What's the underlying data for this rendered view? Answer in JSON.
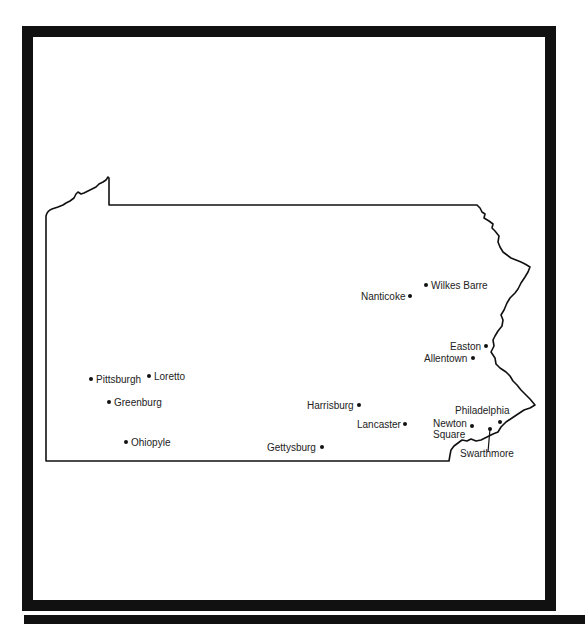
{
  "map": {
    "region": "Pennsylvania",
    "cities": [
      {
        "name": "Pittsburgh",
        "label": "Pittsburgh",
        "dot": [
          91,
          379
        ],
        "label_pos": [
          96,
          374
        ],
        "align": "left"
      },
      {
        "name": "Loretto",
        "label": "Loretto",
        "dot": [
          149,
          376
        ],
        "label_pos": [
          154,
          371
        ],
        "align": "left"
      },
      {
        "name": "Greenburg",
        "label": "Greenburg",
        "dot": [
          109,
          402
        ],
        "label_pos": [
          114,
          397
        ],
        "align": "left"
      },
      {
        "name": "Ohiopyle",
        "label": "Ohiopyle",
        "dot": [
          126,
          442
        ],
        "label_pos": [
          131,
          437
        ],
        "align": "left"
      },
      {
        "name": "Wilkes Barre",
        "label": "Wilkes Barre",
        "dot": [
          426,
          285
        ],
        "label_pos": [
          431,
          280
        ],
        "align": "left"
      },
      {
        "name": "Nanticoke",
        "label": "Nanticoke",
        "dot": [
          410,
          296
        ],
        "label_pos": [
          361,
          291
        ],
        "align": "right"
      },
      {
        "name": "Easton",
        "label": "Easton",
        "dot": [
          486,
          346
        ],
        "label_pos": [
          450,
          341
        ],
        "align": "right"
      },
      {
        "name": "Allentown",
        "label": "Allentown",
        "dot": [
          473,
          358
        ],
        "label_pos": [
          424,
          353
        ],
        "align": "right"
      },
      {
        "name": "Harrisburg",
        "label": "Harrisburg",
        "dot": [
          359,
          405
        ],
        "label_pos": [
          307,
          400
        ],
        "align": "right"
      },
      {
        "name": "Lancaster",
        "label": "Lancaster",
        "dot": [
          405,
          424
        ],
        "label_pos": [
          357,
          419
        ],
        "align": "right"
      },
      {
        "name": "Gettysburg",
        "label": "Gettysburg",
        "dot": [
          322,
          447
        ],
        "label_pos": [
          267,
          442
        ],
        "align": "right"
      },
      {
        "name": "Philadelphia",
        "label": "Philadelphia",
        "dot": [
          500,
          422
        ],
        "label_pos": [
          455,
          405
        ],
        "align": "left"
      },
      {
        "name": "Newton Square",
        "label": "Newton Square",
        "label_lines": [
          "Newton",
          "Square"
        ],
        "dot": [
          472,
          426
        ],
        "label_pos": [
          433,
          418
        ],
        "align": "left"
      },
      {
        "name": "Swarthmore",
        "label": "Swarthmore",
        "dot": [
          490,
          429
        ],
        "label_pos": [
          460,
          448
        ],
        "align": "left"
      }
    ]
  }
}
